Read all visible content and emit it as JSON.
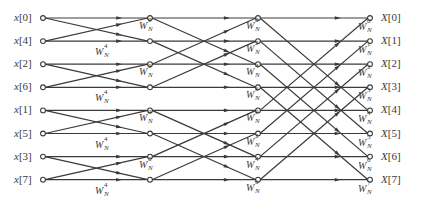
{
  "diagram": {
    "type": "radix-2 decimation-in-time FFT butterfly flow graph",
    "points": 8,
    "stages": 3,
    "colors": {
      "line": "#3a3a3a",
      "background": "#ffffff",
      "text": "#3a3a3a"
    },
    "inputs": [
      "x[0]",
      "x[4]",
      "x[2]",
      "x[6]",
      "x[1]",
      "x[5]",
      "x[3]",
      "x[7]"
    ],
    "outputs": [
      "X[0]",
      "X[1]",
      "X[2]",
      "X[3]",
      "X[4]",
      "X[5]",
      "X[6]",
      "X[7]"
    ],
    "twiddle_base": "W",
    "twiddle_sub": "N",
    "stage1_twiddles": [
      {
        "row": 1,
        "exp": "4"
      },
      {
        "row": 3,
        "exp": "4"
      },
      {
        "row": 5,
        "exp": "4"
      },
      {
        "row": 7,
        "exp": "4"
      }
    ],
    "stage2_twiddles": [
      {
        "row": 0,
        "exp": "0"
      },
      {
        "row": 2,
        "exp": "0"
      },
      {
        "row": 4,
        "exp": "0"
      },
      {
        "row": 6,
        "exp": "0"
      }
    ],
    "stage3_twiddles": [
      {
        "row": 0,
        "exp": "0"
      },
      {
        "row": 1,
        "exp": "2"
      },
      {
        "row": 2,
        "exp": "4"
      },
      {
        "row": 3,
        "exp": "6"
      },
      {
        "row": 4,
        "exp": "0"
      },
      {
        "row": 5,
        "exp": "2"
      },
      {
        "row": 6,
        "exp": "4"
      },
      {
        "row": 7,
        "exp": "6"
      }
    ],
    "output_twiddles": [
      {
        "row": 0,
        "exp": "0"
      },
      {
        "row": 1,
        "exp": "1"
      },
      {
        "row": 2,
        "exp": "2"
      },
      {
        "row": 3,
        "exp": "3"
      },
      {
        "row": 4,
        "exp": "4"
      },
      {
        "row": 5,
        "exp": "5"
      },
      {
        "row": 6,
        "exp": "6"
      },
      {
        "row": 7,
        "exp": "7"
      }
    ]
  }
}
